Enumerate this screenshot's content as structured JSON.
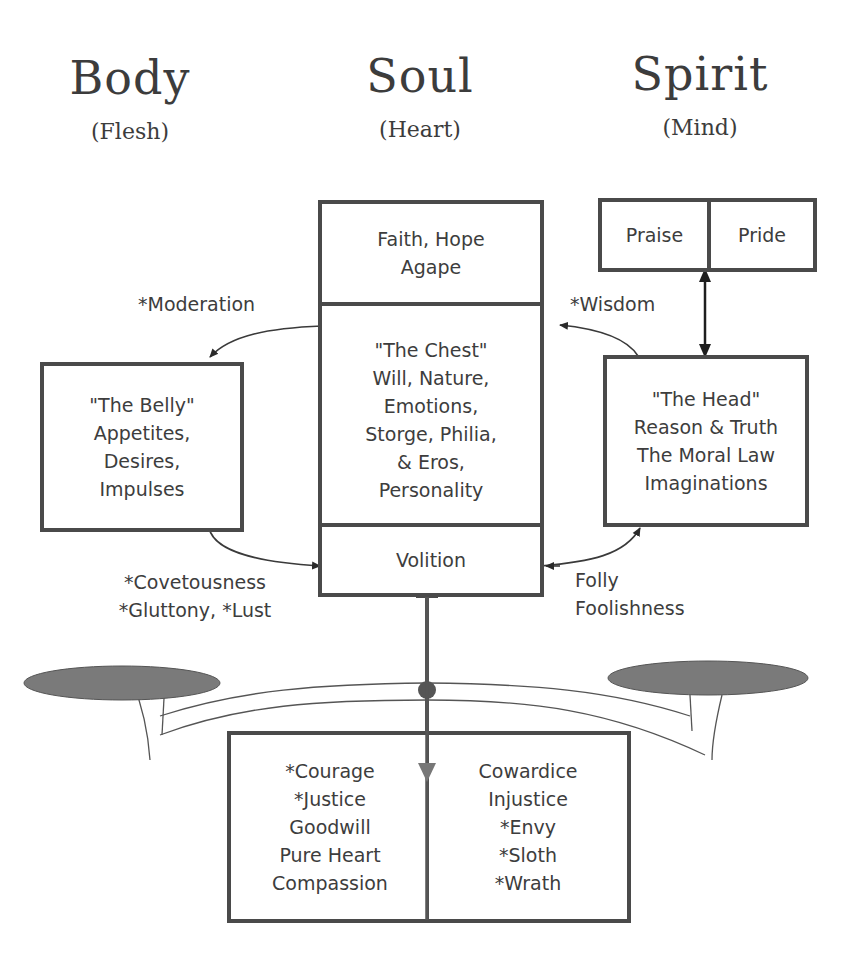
{
  "headings": {
    "body": {
      "title": "Body",
      "subtitle": "(Flesh)"
    },
    "soul": {
      "title": "Soul",
      "subtitle": "(Heart)"
    },
    "spirit": {
      "title": "Spirit",
      "subtitle": "(Mind)"
    }
  },
  "boxes": {
    "faith": {
      "lines": [
        "Faith, Hope",
        "Agape"
      ]
    },
    "praise": {
      "label": "Praise"
    },
    "pride": {
      "label": "Pride"
    },
    "belly": {
      "lines": [
        "\"The Belly\"",
        "Appetites,",
        "Desires,",
        "Impulses"
      ]
    },
    "chest": {
      "lines": [
        "\"The Chest\"",
        "Will, Nature,",
        "Emotions,",
        "Storge, Philia,",
        "& Eros,",
        "Personality"
      ]
    },
    "head": {
      "lines": [
        "\"The Head\"",
        "Reason & Truth",
        "The Moral Law",
        "Imaginations"
      ]
    },
    "volition": {
      "label": "Volition"
    },
    "virtues": {
      "lines": [
        "*Courage",
        "*Justice",
        "Goodwill",
        "Pure Heart",
        "Compassion"
      ]
    },
    "vices": {
      "lines": [
        "Cowardice",
        "Injustice",
        "*Envy",
        "*Sloth",
        "*Wrath"
      ]
    }
  },
  "labels": {
    "moderation": "*Moderation",
    "wisdom": "*Wisdom",
    "covetousness": [
      "*Covetousness",
      "*Gluttony, *Lust"
    ],
    "folly": [
      "Folly",
      "Foolishness"
    ]
  },
  "colors": {
    "stroke": "#4a4a4a",
    "text": "#3d3d3d",
    "pan_fill": "#7a7a7a",
    "arrow_shaft": "#555555"
  }
}
